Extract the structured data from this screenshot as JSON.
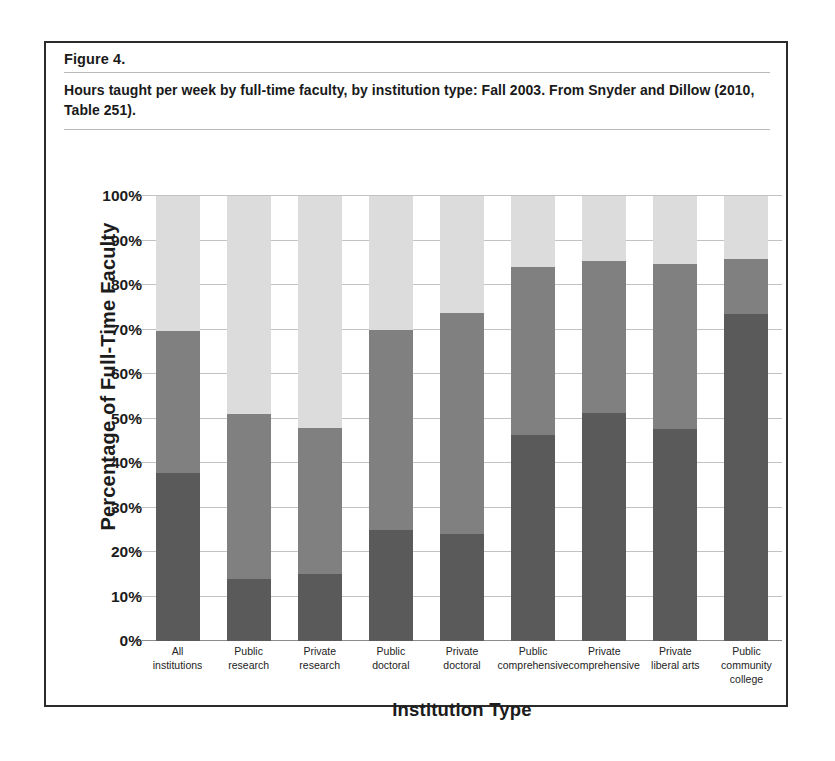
{
  "figure": {
    "number": "Figure 4.",
    "caption": "Hours taught per week by full-time faculty, by institution type: Fall 2003. From Snyder and Dillow (2010, Table 251)."
  },
  "colors": {
    "series_10plus": "#5a5a5a",
    "series_4to99": "#808080",
    "series_lessthan4": "#dcdcdc",
    "gridline": "#c2c2c2",
    "frame": "#2b2b2b",
    "text": "#1c1c1c"
  },
  "chart_data": {
    "type": "bar",
    "stacked": true,
    "title": "Hours taught per week by full-time faculty, by institution type: Fall 2003.",
    "xlabel": "Institution Type",
    "ylabel": "Percentage of Full-Time Faculty",
    "ylim": [
      0,
      100
    ],
    "yticks": [
      "0%",
      "10%",
      "20%",
      "30%",
      "40%",
      "50%",
      "60%",
      "70%",
      "80%",
      "90%",
      "100%"
    ],
    "ytick_values": [
      0,
      10,
      20,
      30,
      40,
      50,
      60,
      70,
      80,
      90,
      100
    ],
    "grid": true,
    "legend_position": "bottom",
    "categories": [
      "All institutions",
      "Public research",
      "Private research",
      "Public doctoral",
      "Private doctoral",
      "Public comprehensive",
      "Private comprehensive",
      "Private liberal arts",
      "Public community college"
    ],
    "category_lines": [
      [
        "All",
        "institutions"
      ],
      [
        "Public",
        "research"
      ],
      [
        "Private",
        "research"
      ],
      [
        "Public",
        "doctoral"
      ],
      [
        "Private",
        "doctoral"
      ],
      [
        "Public",
        "comprehensive"
      ],
      [
        "Private",
        "comprehensive"
      ],
      [
        "Private",
        "liberal arts"
      ],
      [
        "Public",
        "community",
        "college"
      ]
    ],
    "series": [
      {
        "name": "10+ hours",
        "color": "#5a5a5a",
        "values": [
          37.8,
          13.9,
          15.0,
          25.0,
          24.0,
          46.3,
          51.2,
          47.6,
          73.5
        ]
      },
      {
        "name": "4.0-9.9 hours",
        "color": "#808080",
        "values": [
          31.9,
          37.1,
          32.9,
          45.0,
          49.8,
          37.7,
          34.2,
          37.2,
          12.3
        ]
      },
      {
        "name": "Less than 4 hours",
        "color": "#dcdcdc",
        "values": [
          30.3,
          49.0,
          52.1,
          30.0,
          26.2,
          16.0,
          14.6,
          15.2,
          14.2
        ]
      }
    ],
    "cumulative_tops": {
      "series_1_top": [
        37.8,
        13.9,
        15.0,
        25.0,
        24.0,
        46.3,
        51.2,
        47.6,
        73.5
      ],
      "series_2_top": [
        69.7,
        51.0,
        47.9,
        70.0,
        73.8,
        84.0,
        85.4,
        84.8,
        85.8
      ],
      "series_3_top": [
        100,
        100,
        100,
        100,
        100,
        100,
        100,
        100,
        100
      ]
    }
  },
  "legend": {
    "items": [
      {
        "label": "10+ hours",
        "color": "#5a5a5a"
      },
      {
        "label": "4.0-9.9 hours",
        "color": "#808080"
      },
      {
        "label": "Less than 4 hours",
        "color": "#dcdcdc"
      }
    ]
  }
}
